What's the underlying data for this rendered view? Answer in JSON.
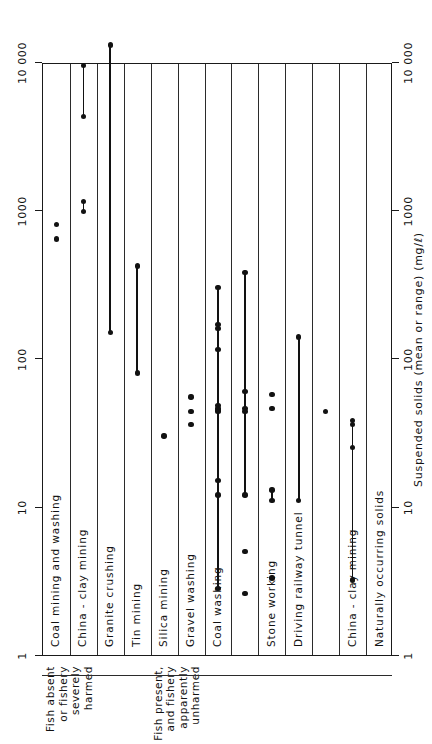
{
  "chart_data": {
    "type": "scatter",
    "orientation": "horizontal-ranges-log",
    "title": "",
    "xlabel": "Suspended solids (mean or range) (mg/ℓ)",
    "ylabel": "",
    "xscale": "log",
    "xlim": [
      1,
      10000
    ],
    "xticks": [
      1,
      10,
      100,
      1000,
      10000
    ],
    "xticklabels": [
      "1",
      "10",
      "100",
      "1000",
      "10 000"
    ],
    "grid": false,
    "legend": null,
    "groups": [
      {
        "label": "Fish absent\nor fishery\nseverely\nharmed",
        "label_lines": [
          "Fish absent",
          "or fishery",
          "severely",
          "harmed"
        ],
        "rows": [
          0,
          1,
          2,
          3
        ]
      },
      {
        "label": "Fish present,\nand fishery\napparently\nunharmed",
        "label_lines": [
          "Fish present,",
          "and fishery",
          "apparently",
          "unharmed"
        ],
        "rows": [
          4,
          5,
          6,
          7,
          8,
          9,
          10,
          11,
          12
        ]
      }
    ],
    "categories": [
      "Coal mining and washing",
      "China - clay mining",
      "Granite crushing",
      "Tin mining",
      "Silica mining",
      "Gravel washing",
      "Coal washing",
      "",
      "Stone working",
      "Driving railway tunnel",
      "",
      "China - clay mining",
      "Naturally occurring solids"
    ],
    "rows": [
      {
        "category": "Coal mining and washing",
        "points": [
          800,
          640
        ],
        "ranges": []
      },
      {
        "category": "China - clay mining",
        "points": [],
        "ranges": [
          [
            4300,
            9500
          ],
          [
            980,
            1150
          ]
        ]
      },
      {
        "category": "Granite crushing",
        "points": [],
        "ranges": [
          [
            150,
            13000
          ]
        ]
      },
      {
        "category": "Tin mining",
        "points": [],
        "ranges": [
          [
            80,
            420
          ]
        ]
      },
      {
        "category": "Silica mining",
        "points": [
          30
        ],
        "ranges": []
      },
      {
        "category": "Gravel washing",
        "points": [
          55,
          44,
          36
        ],
        "ranges": []
      },
      {
        "category": "Coal washing",
        "points": [
          170,
          160,
          115,
          48,
          46,
          45,
          44
        ],
        "ranges": [
          [
            2.8,
            300
          ],
          [
            12,
            15
          ]
        ]
      },
      {
        "category": "",
        "points": [
          60,
          5.0,
          2.6
        ],
        "ranges": [
          [
            12,
            380
          ],
          [
            44,
            46
          ]
        ]
      },
      {
        "category": "Stone working",
        "points": [
          57,
          46,
          3.3
        ],
        "ranges": [
          [
            11,
            13
          ]
        ]
      },
      {
        "category": "Driving railway tunnel",
        "points": [],
        "ranges": [
          [
            11,
            140
          ]
        ]
      },
      {
        "category": "",
        "points": [
          44
        ],
        "ranges": []
      },
      {
        "category": "China - clay mining",
        "points": [
          38,
          25
        ],
        "ranges": [
          [
            3.2,
            36
          ]
        ]
      },
      {
        "category": "Naturally occurring solids",
        "points": [],
        "ranges": []
      }
    ]
  },
  "axis": {
    "top_ticklabels": [
      "10 000",
      "1000",
      "100",
      "10",
      "1"
    ],
    "bottom_ticklabels": [
      "10 000",
      "1000",
      "100",
      "10",
      "1"
    ],
    "xlabel": "Suspended solids (mean or range) (mg/ℓ)"
  },
  "groups": {
    "first": {
      "lines": [
        "Fish absent",
        "or fishery",
        "severely",
        "harmed"
      ]
    },
    "second": {
      "lines": [
        "Fish present,",
        "and fishery",
        "apparently",
        "unharmed"
      ]
    }
  }
}
